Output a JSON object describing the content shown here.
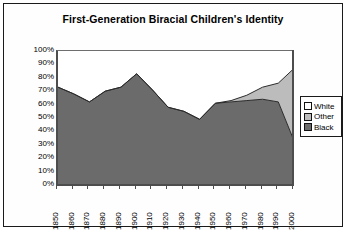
{
  "chart_data": {
    "type": "area",
    "title": "First-Generation Biracial Children's Identity",
    "xlabel": "",
    "ylabel": "",
    "ylim": [
      0,
      100
    ],
    "ytick_labels": [
      "100%",
      "90%",
      "80%",
      "70%",
      "60%",
      "50%",
      "40%",
      "30%",
      "20%",
      "10%",
      "0%"
    ],
    "ytick_values": [
      100,
      90,
      80,
      70,
      60,
      50,
      40,
      30,
      20,
      10,
      0
    ],
    "grid": false,
    "stacked": true,
    "stack_total": 100,
    "legend_position": "right",
    "categories": [
      "1850",
      "1860",
      "1870",
      "1880",
      "1890",
      "1900",
      "1910",
      "1920",
      "1930",
      "1940",
      "1950",
      "1960",
      "1970",
      "1980",
      "1990",
      "2000"
    ],
    "x": [
      1850,
      1860,
      1870,
      1880,
      1890,
      1900,
      1910,
      1920,
      1930,
      1940,
      1950,
      1960,
      1970,
      1980,
      1990,
      2000
    ],
    "series": [
      {
        "name": "Black",
        "color": "#6b6b6b",
        "values": [
          73,
          68,
          62,
          70,
          73,
          83,
          71,
          58,
          55,
          49,
          61,
          62,
          63,
          64,
          62,
          33
        ]
      },
      {
        "name": "Other",
        "color": "#bcbcbc",
        "values": [
          0,
          0,
          0,
          0,
          0,
          0,
          0,
          0,
          0,
          0,
          0,
          1,
          4,
          9,
          14,
          54
        ]
      },
      {
        "name": "White",
        "color": "#ffffff",
        "values": [
          27,
          32,
          38,
          30,
          27,
          17,
          29,
          42,
          45,
          51,
          39,
          37,
          33,
          27,
          24,
          13
        ]
      }
    ],
    "cumulative_black_plus_other": [
      73,
      68,
      62,
      70,
      73,
      83,
      71,
      58,
      55,
      49,
      61,
      63,
      67,
      73,
      76,
      87
    ]
  },
  "legend": {
    "items": [
      {
        "label": "White",
        "swatch": "#ffffff"
      },
      {
        "label": "Other",
        "swatch": "#bcbcbc"
      },
      {
        "label": "Black",
        "swatch": "#6b6b6b"
      }
    ]
  }
}
